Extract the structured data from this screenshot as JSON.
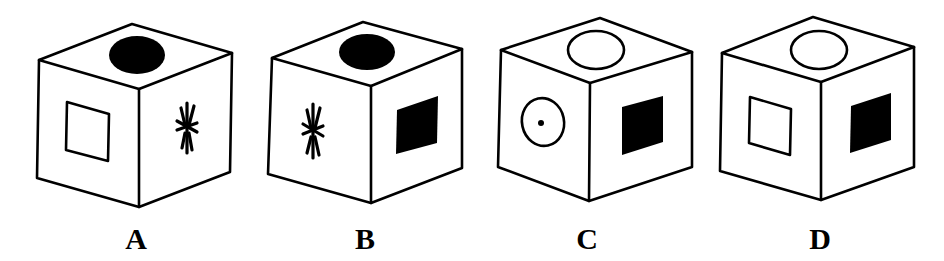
{
  "figure": {
    "type": "cube-folding-options",
    "ink_color": "#000000",
    "paper_color": "#ffffff"
  },
  "options": [
    {
      "label": "A",
      "faces": {
        "top": "filled-circle",
        "left": "outlined-square",
        "right": "asterisk"
      }
    },
    {
      "label": "B",
      "faces": {
        "top": "filled-circle",
        "left": "asterisk",
        "right": "filled-square"
      }
    },
    {
      "label": "C",
      "faces": {
        "top": "outlined-circle",
        "left": "circle-with-dot",
        "right": "filled-square"
      }
    },
    {
      "label": "D",
      "faces": {
        "top": "outlined-circle",
        "left": "outlined-square",
        "right": "filled-square"
      }
    }
  ]
}
